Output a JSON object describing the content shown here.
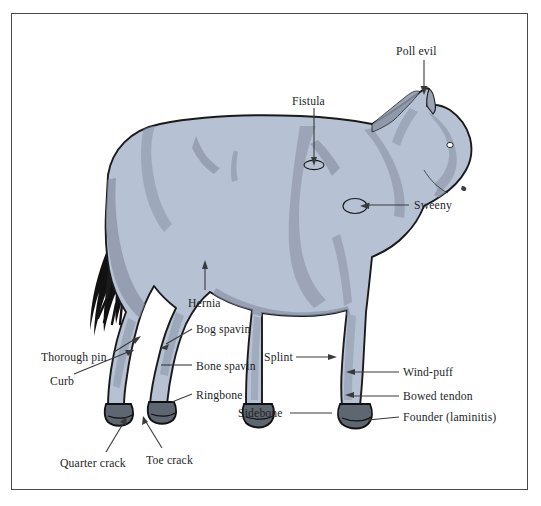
{
  "figure": {
    "border_color": "#4a4a4a",
    "background_color": "#ffffff",
    "body_fill": "#b6c2d4",
    "body_shade": "#8a93a5",
    "body_shade_dark": "#78818f",
    "outline_color": "#1a1a1a",
    "hoof_fill": "#5e6672",
    "tail_color": "#111111",
    "leader_color": "#3a3a3a",
    "text_color": "#221f1f"
  },
  "labels": [
    {
      "id": "poll-evil",
      "text": "Poll evil",
      "x": 396,
      "y": 46,
      "marker": "arrow"
    },
    {
      "id": "fistula",
      "text": "Fistula",
      "x": 292,
      "y": 96,
      "marker": "ellipse"
    },
    {
      "id": "sweeny",
      "text": "Sweeny",
      "x": 414,
      "y": 200,
      "marker": "ellipse"
    },
    {
      "id": "hernia",
      "text": "Hernia",
      "x": 188,
      "y": 298,
      "marker": "arrow"
    },
    {
      "id": "bog-spavin",
      "text": "Bog spavin",
      "x": 196,
      "y": 324,
      "marker": "line"
    },
    {
      "id": "thorough-pin",
      "text": "Thorough pin",
      "x": 41,
      "y": 352,
      "marker": "arrow"
    },
    {
      "id": "bone-spavin",
      "text": "Bone spavin",
      "x": 196,
      "y": 361,
      "marker": "line"
    },
    {
      "id": "splint",
      "text": "Splint",
      "x": 264,
      "y": 352,
      "marker": "arrow"
    },
    {
      "id": "curb",
      "text": "Curb",
      "x": 50,
      "y": 376,
      "marker": "arrow"
    },
    {
      "id": "ringbone",
      "text": "Ringbone",
      "x": 196,
      "y": 390,
      "marker": "line"
    },
    {
      "id": "wind-puff",
      "text": "Wind-puff",
      "x": 403,
      "y": 367,
      "marker": "line"
    },
    {
      "id": "bowed-tendon",
      "text": "Bowed tendon",
      "x": 403,
      "y": 391,
      "marker": "line"
    },
    {
      "id": "sidebone",
      "text": "Sidebone",
      "x": 238,
      "y": 408,
      "marker": "line"
    },
    {
      "id": "founder-laminitis",
      "text": "Founder (laminitis)",
      "x": 403,
      "y": 412,
      "marker": "line"
    },
    {
      "id": "quarter-crack",
      "text": "Quarter crack",
      "x": 60,
      "y": 458,
      "marker": "arrow"
    },
    {
      "id": "toe-crack",
      "text": "Toe crack",
      "x": 146,
      "y": 455,
      "marker": "arrow"
    }
  ]
}
